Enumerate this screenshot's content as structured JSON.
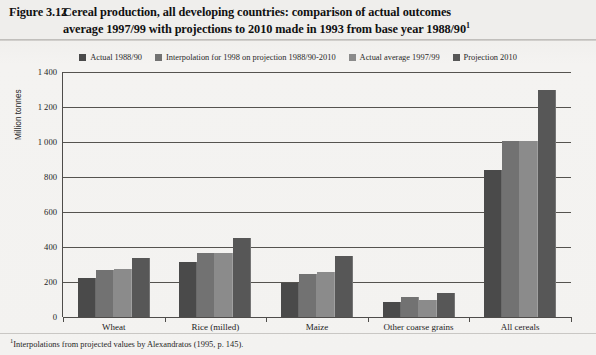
{
  "figure": {
    "label": "Figure 3.12",
    "title_line1": "Cereal production, all developing countries: comparison of actual outcomes",
    "title_line2": "average 1997/99 with projections to 2010 made in 1993 from base year 1988/90",
    "title_superscript": "1",
    "footnote_marker": "1",
    "footnote": "Interpolations from projected values by Alexandratos (1995, p. 145)."
  },
  "legend": {
    "position": "top-center",
    "items": [
      {
        "label": "Actual 1988/90",
        "color": "#4a4a4a"
      },
      {
        "label": "Interpolation for 1998 on projection 1988/90-2010",
        "color": "#727272"
      },
      {
        "label": "Actual average 1997/99",
        "color": "#8b8b8b"
      },
      {
        "label": "Projection 2010",
        "color": "#575757"
      }
    ]
  },
  "axes": {
    "y_title": "Million tonnes",
    "y_ticks": [
      "0",
      "200",
      "400",
      "600",
      "800",
      "1 000",
      "1 200",
      "1 400"
    ],
    "x_labels": [
      "Wheat",
      "Rice (milled)",
      "Maize",
      "Other coarse grains",
      "All cereals"
    ]
  },
  "chart_data": {
    "type": "bar",
    "title": "Cereal production, all developing countries: comparison of actual outcomes average 1997/99 with projections to 2010 made in 1993 from base year 1988/90",
    "xlabel": "",
    "ylabel": "Million tonnes",
    "ylim": [
      0,
      1400
    ],
    "ytick_step": 200,
    "grid": true,
    "legend_position": "top-center",
    "categories": [
      "Wheat",
      "Rice (milled)",
      "Maize",
      "Other coarse grains",
      "All cereals"
    ],
    "series": [
      {
        "name": "Actual 1988/90",
        "color": "#4a4a4a",
        "values": [
          222,
          312,
          196,
          86,
          838
        ]
      },
      {
        "name": "Interpolation for 1998 on projection 1988/90-2010",
        "color": "#727272",
        "values": [
          268,
          367,
          243,
          113,
          1003
        ]
      },
      {
        "name": "Actual average 1997/99",
        "color": "#8b8b8b",
        "values": [
          275,
          366,
          259,
          99,
          1006
        ]
      },
      {
        "name": "Projection 2010",
        "color": "#575757",
        "values": [
          340,
          450,
          347,
          137,
          1300
        ]
      }
    ]
  }
}
